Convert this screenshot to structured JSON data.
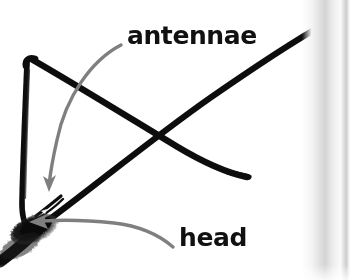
{
  "figure": {
    "kind": "insect-anatomy-photo-with-annotations",
    "background_color": "#ffffff",
    "specimen_color": "#0d0d0d",
    "annotation_color": "#7a7a7a",
    "label_color": "#111111",
    "page_edge_color": "#d6d6d6"
  },
  "labels": {
    "antennae": "antennae",
    "head": "head"
  },
  "annotations": [
    {
      "name": "antennae-arrow",
      "label": "antennae",
      "color": "#7a7a7a",
      "from": [
        120,
        44
      ],
      "to": [
        48,
        188
      ],
      "arrowhead": "down-left"
    },
    {
      "name": "head-arrow",
      "label": "head",
      "color": "#7a7a7a",
      "from": [
        172,
        248
      ],
      "to": [
        32,
        222
      ],
      "arrowhead": "left"
    }
  ],
  "specimen_strokes": [
    {
      "name": "left-antenna",
      "description": "near-vertical thick black stroke from upper bend down to head",
      "points": [
        [
          28,
          62
        ],
        [
          24,
          140
        ],
        [
          22,
          205
        ],
        [
          24,
          228
        ]
      ]
    },
    {
      "name": "upper-bend",
      "description": "sharp bend at top-left of the antenna pair",
      "points": [
        [
          28,
          62
        ],
        [
          36,
          60
        ],
        [
          44,
          64
        ]
      ]
    },
    {
      "name": "descending-antenna",
      "description": "thick black stroke from upper-left bend descending right to a blunt tip",
      "points": [
        [
          36,
          61
        ],
        [
          120,
          112
        ],
        [
          180,
          148
        ],
        [
          225,
          170
        ],
        [
          248,
          177
        ]
      ]
    },
    {
      "name": "ascending-antenna",
      "description": "thick black stroke rising from the head to the upper-right page corner",
      "points": [
        [
          40,
          225
        ],
        [
          110,
          165
        ],
        [
          200,
          100
        ],
        [
          290,
          42
        ],
        [
          333,
          20
        ]
      ]
    },
    {
      "name": "head-mass",
      "description": "fuzzy dark head/body mass at lower-left",
      "points": [
        [
          0,
          258
        ],
        [
          28,
          232
        ],
        [
          52,
          222
        ],
        [
          70,
          228
        ]
      ]
    },
    {
      "name": "palps",
      "description": "short splayed bristles near the head",
      "points": [
        [
          40,
          215
        ],
        [
          58,
          200
        ],
        [
          62,
          196
        ]
      ]
    }
  ]
}
